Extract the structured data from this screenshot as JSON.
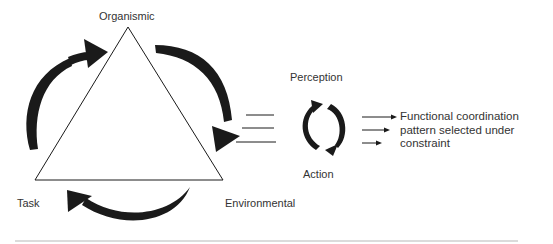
{
  "diagram": {
    "type": "constraints-model",
    "triangle": {
      "vertices": {
        "top": "Organismic",
        "bottom_left": "Task",
        "bottom_right": "Environmental"
      }
    },
    "cycle": {
      "top_label": "Perception",
      "bottom_label": "Action"
    },
    "output": {
      "lines": [
        "Functional coordination",
        "pattern selected under",
        "constraint"
      ]
    },
    "colors": {
      "ink": "#1a1a1a",
      "text": "#333333",
      "rule": "#b8b8b8",
      "background": "#ffffff"
    }
  }
}
